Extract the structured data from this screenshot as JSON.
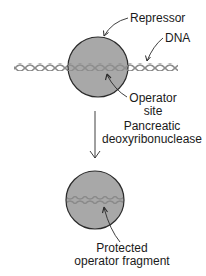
{
  "labels": {
    "repressor": "Repressor",
    "dna": "DNA",
    "operator_site_line1": "Operator",
    "operator_site_line2": "site",
    "enzyme_line1": "Pancreatic",
    "enzyme_line2": "deoxyribonuclease",
    "fragment_line1": "Protected",
    "fragment_line2": "operator fragment"
  },
  "colors": {
    "protein_fill": "#a8a8a8",
    "outline": "#2a2a2a",
    "dna_strand": "#8a8a8a",
    "background": "#ffffff"
  },
  "shapes": {
    "top_repressor": {
      "cx": 98,
      "cy": 67,
      "r": 30
    },
    "bottom_fragment": {
      "cx": 95,
      "cy": 200,
      "r": 29
    },
    "dna_top": {
      "x_start": 14,
      "x_end": 178,
      "y": 67
    },
    "dna_bottom": {
      "x_start": 67,
      "x_end": 123,
      "y": 200
    },
    "digest_arrow": {
      "x": 95,
      "y_start": 111,
      "y_end": 158
    }
  }
}
